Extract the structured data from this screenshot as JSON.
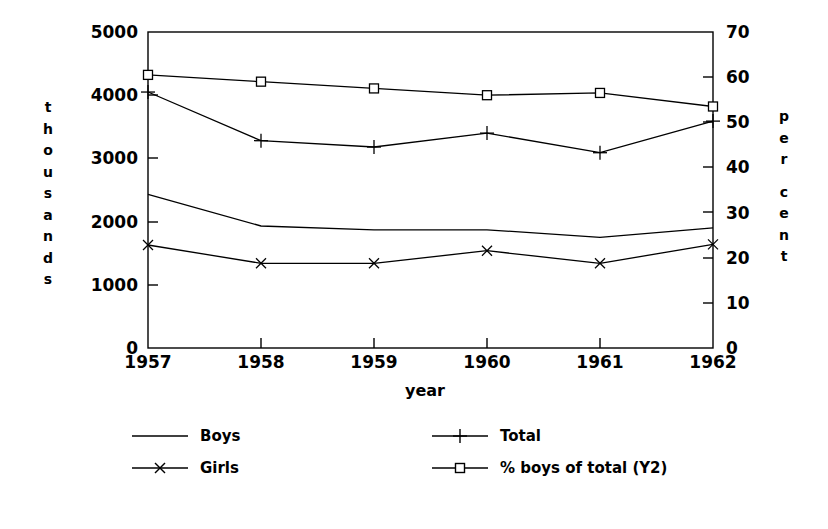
{
  "chart_data": {
    "type": "line",
    "title": "",
    "xlabel": "year",
    "ylabel": "thousands",
    "y2label": "per cent",
    "categories": [
      "1957",
      "1958",
      "1959",
      "1960",
      "1961",
      "1962"
    ],
    "x": [
      1957,
      1958,
      1959,
      1960,
      1961,
      1962
    ],
    "ylim": [
      0,
      5000
    ],
    "y2lim": [
      0,
      70
    ],
    "yticks": [
      "0",
      "1000",
      "2000",
      "3000",
      "4000",
      "5000"
    ],
    "ytick_values": [
      0,
      1000,
      2000,
      3000,
      4000,
      5000
    ],
    "y2ticks": [
      "0",
      "10",
      "20",
      "30",
      "40",
      "50",
      "60",
      "70"
    ],
    "y2tick_values": [
      0,
      10,
      20,
      30,
      40,
      50,
      60,
      70
    ],
    "grid": false,
    "legend_position": "below",
    "series": [
      {
        "name": "Boys",
        "axis": "y1",
        "marker": "none",
        "values": [
          2430,
          1930,
          1870,
          1870,
          1750,
          1900
        ]
      },
      {
        "name": "Girls",
        "axis": "y1",
        "marker": "cross-x",
        "values": [
          1630,
          1340,
          1340,
          1540,
          1340,
          1640
        ]
      },
      {
        "name": "Total",
        "axis": "y1",
        "marker": "plus",
        "values": [
          4050,
          3280,
          3180,
          3400,
          3090,
          3590
        ]
      },
      {
        "name": "% boys of total (Y2)",
        "axis": "y2",
        "marker": "square",
        "values": [
          60.5,
          59.0,
          57.5,
          56.0,
          56.5,
          53.5
        ]
      }
    ]
  },
  "axes": {
    "left_title_chars": [
      "t",
      "h",
      "o",
      "u",
      "s",
      "a",
      "n",
      "d",
      "s"
    ],
    "right_title_chars": [
      "p",
      "e",
      "r",
      "",
      "c",
      "e",
      "n",
      "t"
    ]
  },
  "legend": {
    "items": [
      {
        "label": "Boys",
        "marker": "none"
      },
      {
        "label": "Girls",
        "marker": "cross-x"
      },
      {
        "label": "Total",
        "marker": "plus"
      },
      {
        "label": "% boys of total (Y2)",
        "marker": "square"
      }
    ]
  },
  "colors": {
    "line": "#000000",
    "axis": "#000000",
    "background": "#ffffff"
  }
}
